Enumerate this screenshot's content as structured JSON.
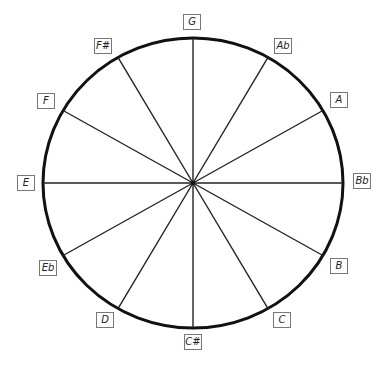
{
  "diagram": {
    "type": "circle-of-notes",
    "center": [
      193,
      183
    ],
    "radius_x": 150,
    "radius_y": 145,
    "stroke_color": "#111111",
    "notes": [
      {
        "label": "G",
        "x": 192,
        "y": 22
      },
      {
        "label": "Ab",
        "x": 283,
        "y": 46
      },
      {
        "label": "A",
        "x": 339,
        "y": 100
      },
      {
        "label": "Bb",
        "x": 362,
        "y": 181
      },
      {
        "label": "B",
        "x": 339,
        "y": 266
      },
      {
        "label": "C",
        "x": 282,
        "y": 320
      },
      {
        "label": "C#",
        "x": 193,
        "y": 342
      },
      {
        "label": "D",
        "x": 105,
        "y": 320
      },
      {
        "label": "Eb",
        "x": 48,
        "y": 268
      },
      {
        "label": "E",
        "x": 26,
        "y": 183
      },
      {
        "label": "F",
        "x": 46,
        "y": 101
      },
      {
        "label": "F#",
        "x": 103,
        "y": 46
      }
    ]
  }
}
